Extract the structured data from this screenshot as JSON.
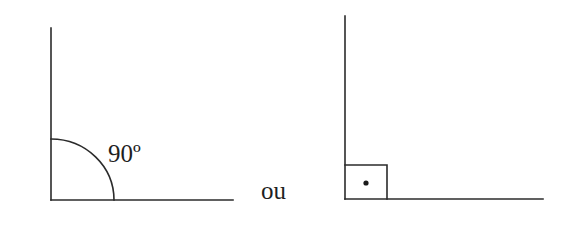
{
  "diagram": {
    "stroke_color": "#2b2b2b",
    "text_color": "#1f1f1f",
    "left_figure": {
      "kind": "right-angle-with-arc",
      "angle_label": "90º",
      "vertex": [
        51,
        200
      ],
      "vertical_arm_top": [
        51,
        28
      ],
      "horizontal_arm_end": [
        233,
        200
      ],
      "arc_radius": 62
    },
    "separator_text": "ou",
    "right_figure": {
      "kind": "right-angle-with-square-marker",
      "vertex": [
        345,
        199
      ],
      "vertical_arm_top": [
        345,
        16
      ],
      "horizontal_arm_end": [
        543,
        199
      ],
      "square_size": [
        42,
        34
      ],
      "dot_center": [
        366,
        183
      ]
    }
  }
}
